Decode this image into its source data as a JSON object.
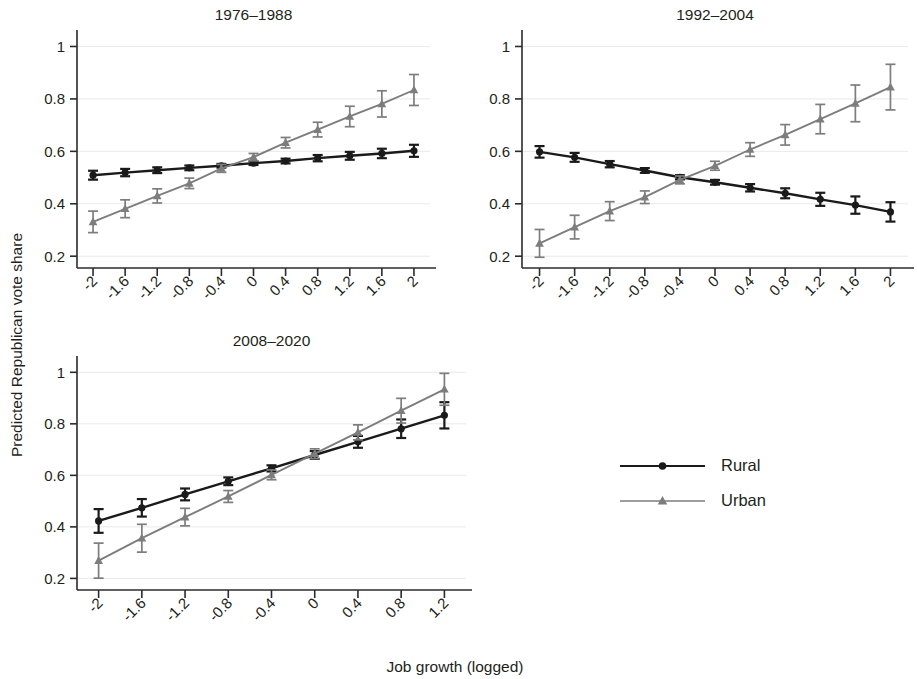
{
  "figure": {
    "xlabel": "Job growth (logged)",
    "ylabel": "Predicted Republican vote share",
    "background": "#ffffff"
  },
  "legend": {
    "position": "bottom-right",
    "items": [
      {
        "label": "Rural",
        "color": "#1a1a1a",
        "marker": "circle"
      },
      {
        "label": "Urban",
        "color": "#7d7d7d",
        "marker": "triangle"
      }
    ]
  },
  "axes": {
    "y_ticks": [
      "0.2",
      "0.4",
      "0.6",
      "0.8",
      "1"
    ],
    "y_values": [
      0.2,
      0.4,
      0.6,
      0.8,
      1.0
    ],
    "ylim": [
      0.155,
      1.04
    ],
    "x_ticks_full": [
      "-2",
      "-1.6",
      "-1.2",
      "-0.8",
      "-0.4",
      "0",
      "0.4",
      "0.8",
      "1.2",
      "1.6",
      "2"
    ],
    "x_values_full": [
      -2,
      -1.6,
      -1.2,
      -0.8,
      -0.4,
      0,
      0.4,
      0.8,
      1.2,
      1.6,
      2
    ],
    "x_ticks_short": [
      "-2",
      "-1.6",
      "-1.2",
      "-0.8",
      "-0.4",
      "0",
      "0.4",
      "0.8",
      "1.2"
    ],
    "x_values_short": [
      -2,
      -1.6,
      -1.2,
      -0.8,
      -0.4,
      0,
      0.4,
      0.8,
      1.2
    ],
    "xlim_full": [
      -2.2,
      2.2
    ],
    "xlim_short": [
      -2.2,
      1.4
    ]
  },
  "chart_data": [
    {
      "type": "line",
      "title": "1976–1988",
      "xlabel": "Job growth (logged)",
      "ylabel": "Predicted Republican vote share",
      "ylim": [
        0.155,
        1.04
      ],
      "xlim": [
        -2.2,
        2.2
      ],
      "grid": true,
      "x": [
        -2,
        -1.6,
        -1.2,
        -0.8,
        -0.4,
        0,
        0.4,
        0.8,
        1.2,
        1.6,
        2
      ],
      "series": [
        {
          "name": "Rural",
          "color": "#1a1a1a",
          "marker": "circle",
          "values": [
            0.509,
            0.519,
            0.528,
            0.537,
            0.545,
            0.555,
            0.563,
            0.574,
            0.583,
            0.592,
            0.602
          ],
          "err_low": [
            0.492,
            0.505,
            0.517,
            0.528,
            0.538,
            0.548,
            0.554,
            0.562,
            0.568,
            0.574,
            0.579
          ],
          "err_high": [
            0.526,
            0.533,
            0.539,
            0.546,
            0.552,
            0.562,
            0.572,
            0.586,
            0.598,
            0.61,
            0.625
          ]
        },
        {
          "name": "Urban",
          "color": "#7d7d7d",
          "marker": "triangle",
          "values": [
            0.331,
            0.381,
            0.43,
            0.478,
            0.535,
            0.578,
            0.633,
            0.683,
            0.733,
            0.781,
            0.834
          ],
          "err_low": [
            0.29,
            0.347,
            0.403,
            0.458,
            0.52,
            0.564,
            0.613,
            0.655,
            0.694,
            0.731,
            0.775
          ],
          "err_high": [
            0.372,
            0.415,
            0.457,
            0.498,
            0.55,
            0.592,
            0.653,
            0.711,
            0.772,
            0.831,
            0.893
          ]
        }
      ]
    },
    {
      "type": "line",
      "title": "1992–2004",
      "xlabel": "Job growth (logged)",
      "ylabel": "Predicted Republican vote share",
      "ylim": [
        0.155,
        1.04
      ],
      "xlim": [
        -2.2,
        2.2
      ],
      "grid": true,
      "x": [
        -2,
        -1.6,
        -1.2,
        -0.8,
        -0.4,
        0,
        0.4,
        0.8,
        1.2,
        1.6,
        2
      ],
      "series": [
        {
          "name": "Rural",
          "color": "#1a1a1a",
          "marker": "circle",
          "values": [
            0.598,
            0.577,
            0.551,
            0.527,
            0.501,
            0.482,
            0.461,
            0.44,
            0.417,
            0.395,
            0.369
          ],
          "err_low": [
            0.576,
            0.56,
            0.539,
            0.518,
            0.493,
            0.473,
            0.447,
            0.421,
            0.392,
            0.362,
            0.332
          ],
          "err_high": [
            0.62,
            0.594,
            0.563,
            0.536,
            0.509,
            0.491,
            0.475,
            0.459,
            0.442,
            0.428,
            0.406
          ]
        },
        {
          "name": "Urban",
          "color": "#7d7d7d",
          "marker": "triangle",
          "values": [
            0.249,
            0.311,
            0.372,
            0.425,
            0.491,
            0.545,
            0.607,
            0.663,
            0.723,
            0.783,
            0.845
          ],
          "err_low": [
            0.196,
            0.266,
            0.336,
            0.401,
            0.476,
            0.528,
            0.581,
            0.624,
            0.667,
            0.713,
            0.758
          ],
          "err_high": [
            0.302,
            0.356,
            0.408,
            0.449,
            0.506,
            0.562,
            0.633,
            0.702,
            0.779,
            0.853,
            0.932
          ]
        }
      ]
    },
    {
      "type": "line",
      "title": "2008–2020",
      "xlabel": "Job growth (logged)",
      "ylabel": "Predicted Republican vote share",
      "ylim": [
        0.155,
        1.04
      ],
      "xlim": [
        -2.2,
        1.4
      ],
      "grid": true,
      "x": [
        -2,
        -1.6,
        -1.2,
        -0.8,
        -0.4,
        0,
        0.4,
        0.8,
        1.2
      ],
      "series": [
        {
          "name": "Rural",
          "color": "#1a1a1a",
          "marker": "circle",
          "values": [
            0.423,
            0.474,
            0.526,
            0.577,
            0.627,
            0.679,
            0.73,
            0.781,
            0.833
          ],
          "err_low": [
            0.377,
            0.44,
            0.503,
            0.562,
            0.615,
            0.664,
            0.707,
            0.745,
            0.782
          ],
          "err_high": [
            0.469,
            0.508,
            0.549,
            0.592,
            0.639,
            0.694,
            0.753,
            0.817,
            0.884
          ]
        },
        {
          "name": "Urban",
          "color": "#7d7d7d",
          "marker": "triangle",
          "values": [
            0.269,
            0.356,
            0.438,
            0.518,
            0.602,
            0.684,
            0.767,
            0.851,
            0.934
          ],
          "err_low": [
            0.201,
            0.302,
            0.404,
            0.495,
            0.583,
            0.665,
            0.738,
            0.803,
            0.872
          ],
          "err_high": [
            0.337,
            0.41,
            0.472,
            0.541,
            0.621,
            0.703,
            0.796,
            0.899,
            0.996
          ]
        }
      ]
    }
  ]
}
